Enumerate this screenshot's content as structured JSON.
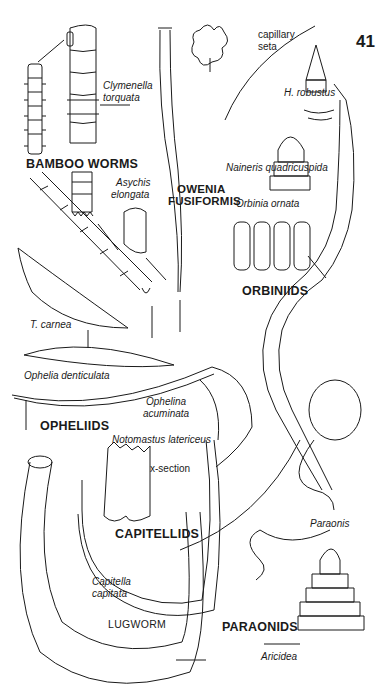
{
  "page": {
    "number": "41",
    "background": "#ffffff",
    "ink": "#1a1a1a"
  },
  "groups": [
    {
      "name": "BAMBOO WORMS",
      "species": [
        "Clymenella torquata",
        "Asychis elongata"
      ]
    },
    {
      "name": "OWENIA FUSIFORMIS",
      "species": []
    },
    {
      "name": "ORBINIIDS",
      "species": [
        "H. robustus",
        "Naineris quadricuspida",
        "Orbinia ornata"
      ]
    },
    {
      "name": "OPHELIIDS",
      "species": [
        "T. carnea",
        "Ophelia denticulata",
        "Ophelina acuminata"
      ]
    },
    {
      "name": "CAPITELLIDS",
      "species": [
        "Notomastus latericeus",
        "Capitella capitata"
      ]
    },
    {
      "name": "LUGWORM",
      "species": []
    },
    {
      "name": "PARAONIDS",
      "species": [
        "Paraonis",
        "Aricidea"
      ]
    }
  ],
  "labels": {
    "clymenella_1": "Clymenella",
    "clymenella_2": "torquata",
    "bamboo": "BAMBOO WORMS",
    "asychis_1": "Asychis",
    "asychis_2": "elongata",
    "owenia_1": "OWENIA",
    "owenia_2": "FUSIFORMIS",
    "capillary_1": "capillary",
    "capillary_2": "seta",
    "h_robustus": "H. robustus",
    "naineris": "Naineris quadricuspida",
    "orbinia": "Orbinia ornata",
    "orbiniids": "ORBINIIDS",
    "t_carnea": "T. carnea",
    "ophelia": "Ophelia denticulata",
    "ophelina_1": "Ophelina",
    "ophelina_2": "acuminata",
    "opheliids": "OPHELIIDS",
    "notomastus": "Notomastus latericeus",
    "xsection": "x-section",
    "capitellids": "CAPITELLIDS",
    "capitella_1": "Capitella",
    "capitella_2": "capitata",
    "lugworm": "LUGWORM",
    "paraonis": "Paraonis",
    "paraonids": "PARAONIDS",
    "aricidea": "Aricidea"
  }
}
